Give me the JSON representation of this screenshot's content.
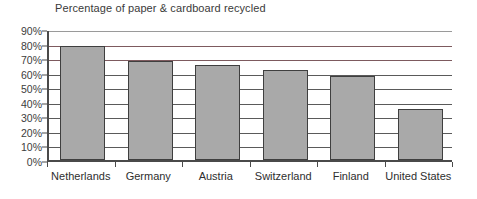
{
  "chart_data": {
    "type": "bar",
    "title": "Percentage of paper & cardboard recycled",
    "xlabel": "",
    "ylabel": "",
    "ylim": [
      0,
      90
    ],
    "ytick_labels": [
      "90%",
      "80%",
      "70%",
      "60%",
      "50%",
      "40%",
      "30%",
      "20%",
      "10%",
      "0%"
    ],
    "ytick_values": [
      90,
      80,
      70,
      60,
      50,
      40,
      30,
      20,
      10,
      0
    ],
    "grid": true,
    "legend": "none",
    "categories": [
      "Netherlands",
      "Germany",
      "Austria",
      "Switzerland",
      "Finland",
      "United States"
    ],
    "values": [
      78,
      68,
      65,
      62,
      58,
      35
    ],
    "bar_color": "#a9a9a9",
    "bar_border_color": "#3f3f3f",
    "axis_color": "#4a4a4a",
    "gridline_color": "#5a5a5a",
    "text_color": "#2e2e2e"
  }
}
